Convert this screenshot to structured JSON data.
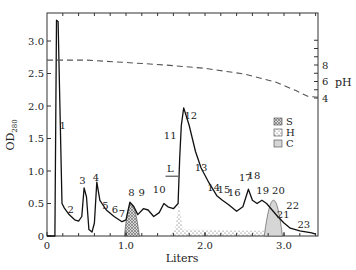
{
  "chart_data": {
    "type": "line",
    "title": "",
    "xlabel": "Liters",
    "ylabel": "OD280",
    "ylabel_main": "OD",
    "ylabel_sub": "280",
    "y2label": "pH",
    "xlim": [
      0,
      3.43
    ],
    "ylim": [
      0,
      3.5
    ],
    "y2lim": [
      4,
      8
    ],
    "grid": false,
    "x_ticks": [
      {
        "value": 0,
        "label": "0"
      },
      {
        "value": 1.0,
        "label": "1.0"
      },
      {
        "value": 2.0,
        "label": "2.0"
      },
      {
        "value": 3.0,
        "label": "3.0"
      }
    ],
    "y_ticks": [
      {
        "value": 0,
        "label": "0"
      },
      {
        "value": 0.5,
        "label": "0.5"
      },
      {
        "value": 1.0,
        "label": "1.0"
      },
      {
        "value": 1.5,
        "label": "1.5"
      },
      {
        "value": 2.0,
        "label": "2.0"
      },
      {
        "value": 2.5,
        "label": "2.5"
      },
      {
        "value": 3.0,
        "label": "3.0"
      }
    ],
    "y2_ticks": [
      {
        "value": 8,
        "label": "8"
      },
      {
        "value": 6,
        "label": "6"
      },
      {
        "value": 4,
        "label": "4"
      }
    ],
    "series": [
      {
        "name": "OD280",
        "style": "solid",
        "points": [
          [
            0.0,
            0.0
          ],
          [
            0.1,
            0.0
          ],
          [
            0.12,
            3.32
          ],
          [
            0.14,
            3.3
          ],
          [
            0.19,
            0.5
          ],
          [
            0.22,
            0.43
          ],
          [
            0.28,
            0.33
          ],
          [
            0.35,
            0.25
          ],
          [
            0.4,
            0.23
          ],
          [
            0.44,
            0.3
          ],
          [
            0.47,
            0.74
          ],
          [
            0.5,
            0.6
          ],
          [
            0.53,
            0.1
          ],
          [
            0.57,
            0.06
          ],
          [
            0.6,
            0.2
          ],
          [
            0.63,
            0.83
          ],
          [
            0.67,
            0.55
          ],
          [
            0.75,
            0.4
          ],
          [
            0.85,
            0.3
          ],
          [
            0.95,
            0.22
          ],
          [
            1.0,
            0.25
          ],
          [
            1.05,
            0.52
          ],
          [
            1.1,
            0.45
          ],
          [
            1.15,
            0.33
          ],
          [
            1.22,
            0.42
          ],
          [
            1.28,
            0.4
          ],
          [
            1.35,
            0.3
          ],
          [
            1.42,
            0.36
          ],
          [
            1.48,
            0.5
          ],
          [
            1.53,
            0.45
          ],
          [
            1.6,
            0.42
          ],
          [
            1.66,
            0.5
          ],
          [
            1.68,
            1.2
          ],
          [
            1.7,
            1.7
          ],
          [
            1.73,
            1.97
          ],
          [
            1.8,
            1.7
          ],
          [
            1.88,
            1.3
          ],
          [
            1.95,
            1.05
          ],
          [
            2.05,
            0.82
          ],
          [
            2.15,
            0.62
          ],
          [
            2.22,
            0.55
          ],
          [
            2.3,
            0.48
          ],
          [
            2.4,
            0.38
          ],
          [
            2.48,
            0.45
          ],
          [
            2.55,
            0.72
          ],
          [
            2.6,
            0.55
          ],
          [
            2.66,
            0.5
          ],
          [
            2.72,
            0.55
          ],
          [
            2.78,
            0.5
          ],
          [
            2.85,
            0.4
          ],
          [
            2.92,
            0.3
          ],
          [
            3.0,
            0.2
          ],
          [
            3.08,
            0.12
          ],
          [
            3.2,
            0.08
          ],
          [
            3.35,
            0.05
          ],
          [
            3.4,
            0.03
          ]
        ]
      },
      {
        "name": "pH",
        "style": "dashed",
        "axis": "y2",
        "points": [
          [
            0.0,
            8.6
          ],
          [
            0.5,
            8.6
          ],
          [
            1.0,
            8.3
          ],
          [
            1.5,
            8.0
          ],
          [
            2.0,
            7.6
          ],
          [
            2.5,
            6.9
          ],
          [
            2.9,
            5.9
          ],
          [
            3.15,
            4.9
          ],
          [
            3.3,
            4.2
          ],
          [
            3.43,
            4.1
          ]
        ]
      }
    ],
    "shaded_regions": [
      {
        "name": "S",
        "pattern": "crosshatch",
        "x_range": [
          0.98,
          1.17
        ],
        "peak_x": 1.06,
        "peak_y": 0.52
      },
      {
        "name": "H",
        "pattern": "dots",
        "x_range": [
          1.55,
          2.75
        ],
        "peak_x": 1.67,
        "peak_y": 0.5
      },
      {
        "name": "C",
        "pattern": "light-gray-fill",
        "x_range": [
          2.75,
          2.98
        ],
        "peak_x": 2.87,
        "peak_y": 0.58
      }
    ],
    "legend": {
      "position": "upper-right-inside",
      "entries": [
        {
          "key": "S",
          "label": "S",
          "pattern": "crosshatch"
        },
        {
          "key": "H",
          "label": "H",
          "pattern": "dots"
        },
        {
          "key": "C",
          "label": "C",
          "pattern": "light-gray-fill"
        }
      ]
    },
    "annotations": [
      {
        "text": "1",
        "x": 0.2,
        "y": 1.65
      },
      {
        "text": "2",
        "x": 0.3,
        "y": 0.35
      },
      {
        "text": "3",
        "x": 0.45,
        "y": 0.8
      },
      {
        "text": "4",
        "x": 0.62,
        "y": 0.85
      },
      {
        "text": "5",
        "x": 0.74,
        "y": 0.42
      },
      {
        "text": "6",
        "x": 0.86,
        "y": 0.35
      },
      {
        "text": "7",
        "x": 0.95,
        "y": 0.3
      },
      {
        "text": "8",
        "x": 1.07,
        "y": 0.62
      },
      {
        "text": "9",
        "x": 1.2,
        "y": 0.62
      },
      {
        "text": "10",
        "x": 1.42,
        "y": 0.66
      },
      {
        "text": "11",
        "x": 1.56,
        "y": 1.5
      },
      {
        "text": "12",
        "x": 1.82,
        "y": 1.8
      },
      {
        "text": "L",
        "x": 1.56,
        "y": 0.98
      },
      {
        "text": "13",
        "x": 1.95,
        "y": 1.0
      },
      {
        "text": "14",
        "x": 2.11,
        "y": 0.7
      },
      {
        "text": "15",
        "x": 2.24,
        "y": 0.66
      },
      {
        "text": "16",
        "x": 2.37,
        "y": 0.62
      },
      {
        "text": "17",
        "x": 2.51,
        "y": 0.84
      },
      {
        "text": "18",
        "x": 2.62,
        "y": 0.88
      },
      {
        "text": "19",
        "x": 2.73,
        "y": 0.64
      },
      {
        "text": "20",
        "x": 2.93,
        "y": 0.64
      },
      {
        "text": "21",
        "x": 2.99,
        "y": 0.28
      },
      {
        "text": "22",
        "x": 3.11,
        "y": 0.42
      },
      {
        "text": "23",
        "x": 3.25,
        "y": 0.12
      }
    ]
  }
}
